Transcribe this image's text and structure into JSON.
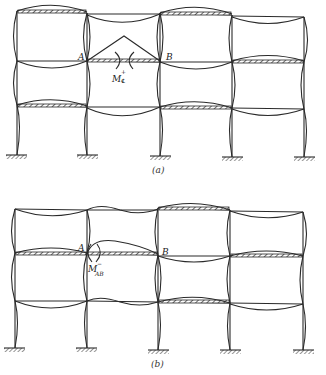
{
  "figure": {
    "panels": [
      {
        "id": "a",
        "caption": "(a)",
        "node_labels": {
          "left": "A",
          "right": "B"
        },
        "moment_label": {
          "main": "M",
          "superscript": "+",
          "subscript": "℄"
        },
        "description": "Checkerboard loading for maximum positive midspan moment in beam AB"
      },
      {
        "id": "b",
        "caption": "(b)",
        "node_labels": {
          "left": "A",
          "right": "B"
        },
        "moment_label": {
          "main": "M",
          "superscript": "−",
          "subscript": "AB"
        },
        "description": "Loading pattern for maximum negative moment at end A of beam AB"
      }
    ],
    "structure": {
      "type": "multistory frame",
      "bays": 4,
      "stories": 3,
      "supports": "fixed"
    },
    "colors": {
      "line": "#2a2a2a",
      "background": "#ffffff"
    }
  }
}
